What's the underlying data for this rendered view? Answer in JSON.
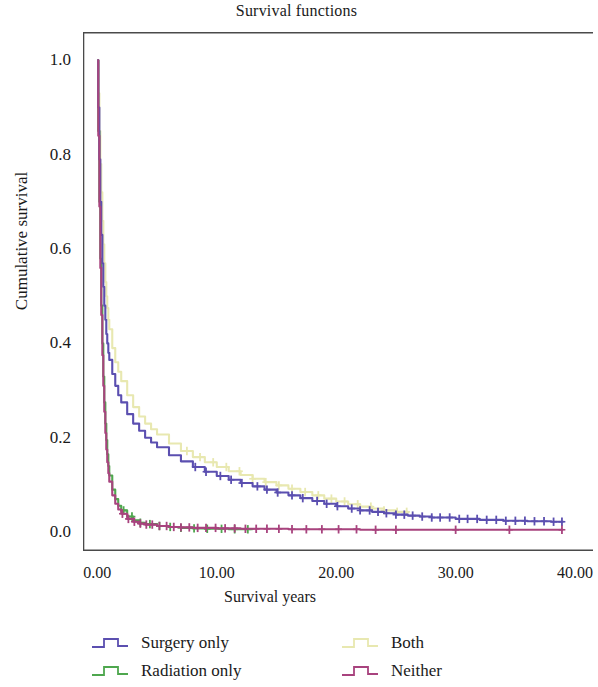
{
  "chart_data": {
    "type": "line",
    "title": "Survival functions",
    "xlabel": "Survival years",
    "ylabel": "Cumulative survival",
    "xlim": [
      -1.2,
      41.5
    ],
    "ylim": [
      -0.04,
      1.06
    ],
    "grid": false,
    "legend_position": "bottom",
    "xticks": [
      "0.00",
      "10.00",
      "20.00",
      "30.00",
      "40.00"
    ],
    "xtick_values": [
      0,
      10,
      20,
      30,
      40
    ],
    "yticks": [
      "0.0",
      "0.2",
      "0.4",
      "0.6",
      "0.8",
      "1.0"
    ],
    "ytick_values": [
      0.0,
      0.2,
      0.4,
      0.6,
      0.8,
      1.0
    ],
    "censor_marker": "plus",
    "series": [
      {
        "name": "Surgery only",
        "color": "#5b4fb0",
        "x": [
          0,
          0.08,
          0.17,
          0.25,
          0.33,
          0.42,
          0.5,
          0.58,
          0.67,
          0.75,
          0.83,
          0.92,
          1.0,
          1.25,
          1.5,
          1.75,
          2.0,
          2.5,
          3.0,
          3.5,
          4.0,
          4.5,
          5.0,
          6.0,
          7.0,
          8.0,
          9.0,
          10.0,
          11.0,
          12.0,
          13.0,
          14.0,
          15.0,
          16.0,
          17.0,
          18.0,
          19.0,
          20.0,
          21.0,
          22.0,
          23.0,
          24.0,
          25.0,
          26.0,
          27.0,
          28.0,
          30.0,
          32.0,
          34.0,
          36.0,
          38.0,
          39.0
        ],
        "y": [
          1.0,
          0.9,
          0.79,
          0.7,
          0.63,
          0.57,
          0.52,
          0.48,
          0.45,
          0.42,
          0.4,
          0.38,
          0.365,
          0.335,
          0.31,
          0.29,
          0.275,
          0.25,
          0.23,
          0.215,
          0.2,
          0.19,
          0.18,
          0.163,
          0.15,
          0.138,
          0.128,
          0.119,
          0.111,
          0.104,
          0.097,
          0.09,
          0.084,
          0.078,
          0.072,
          0.066,
          0.06,
          0.055,
          0.05,
          0.046,
          0.043,
          0.04,
          0.037,
          0.035,
          0.033,
          0.031,
          0.028,
          0.026,
          0.024,
          0.023,
          0.022,
          0.021
        ],
        "censor_x": [
          8.2,
          9.1,
          10.3,
          11.2,
          12.1,
          13.4,
          14.2,
          15.1,
          16.3,
          17.2,
          18.4,
          19.2,
          20.1,
          21.3,
          22.0,
          22.8,
          23.5,
          24.2,
          25.0,
          25.7,
          26.4,
          27.2,
          28.0,
          28.7,
          29.5,
          30.3,
          31.0,
          31.8,
          32.6,
          33.4,
          34.2,
          35.0,
          35.8,
          36.6,
          37.4,
          38.2,
          38.9
        ]
      },
      {
        "name": "Radiation only",
        "color": "#4ea74e",
        "x": [
          0,
          0.08,
          0.17,
          0.25,
          0.33,
          0.42,
          0.5,
          0.58,
          0.67,
          0.75,
          0.83,
          0.92,
          1.0,
          1.25,
          1.5,
          1.75,
          2.0,
          2.5,
          3.0,
          3.5,
          4.0,
          5.0,
          6.0,
          7.0,
          8.0,
          9.0,
          10.0,
          11.0,
          12.0,
          13.0
        ],
        "y": [
          1.0,
          0.85,
          0.7,
          0.58,
          0.48,
          0.4,
          0.33,
          0.275,
          0.23,
          0.195,
          0.165,
          0.14,
          0.12,
          0.09,
          0.07,
          0.056,
          0.046,
          0.033,
          0.025,
          0.02,
          0.017,
          0.013,
          0.011,
          0.009,
          0.008,
          0.007,
          0.007,
          0.006,
          0.006,
          0.005
        ],
        "censor_x": [
          2.2,
          2.9,
          3.6,
          4.4,
          5.2,
          6.1,
          7.0,
          8.1,
          9.2,
          10.4,
          11.5,
          12.6
        ]
      },
      {
        "name": "Both",
        "color": "#e8e8b0",
        "x": [
          0,
          0.08,
          0.17,
          0.25,
          0.33,
          0.42,
          0.5,
          0.58,
          0.67,
          0.75,
          0.83,
          0.92,
          1.0,
          1.25,
          1.5,
          1.75,
          2.0,
          2.5,
          3.0,
          3.5,
          4.0,
          4.5,
          5.0,
          6.0,
          7.0,
          8.0,
          9.0,
          10.0,
          11.0,
          12.0,
          13.0,
          14.0,
          15.0,
          16.0,
          17.0,
          18.0,
          19.0,
          20.0,
          21.0,
          22.0,
          23.0,
          24.0,
          25.0,
          26.0
        ],
        "y": [
          1.0,
          0.93,
          0.85,
          0.78,
          0.72,
          0.66,
          0.61,
          0.57,
          0.53,
          0.5,
          0.475,
          0.45,
          0.43,
          0.39,
          0.36,
          0.34,
          0.32,
          0.29,
          0.265,
          0.245,
          0.23,
          0.218,
          0.207,
          0.188,
          0.172,
          0.159,
          0.148,
          0.138,
          0.129,
          0.121,
          0.113,
          0.106,
          0.099,
          0.092,
          0.085,
          0.078,
          0.071,
          0.065,
          0.059,
          0.054,
          0.05,
          0.046,
          0.043,
          0.04
        ],
        "censor_x": [
          7.5,
          8.6,
          9.7,
          10.8,
          11.9,
          13.0,
          14.1,
          15.2,
          16.3,
          17.4,
          18.5,
          19.6,
          20.7,
          21.8,
          22.9,
          24.0,
          25.1,
          25.9
        ]
      },
      {
        "name": "Neither",
        "color": "#a8437e",
        "x": [
          0,
          0.08,
          0.17,
          0.25,
          0.33,
          0.42,
          0.5,
          0.58,
          0.67,
          0.75,
          0.83,
          0.92,
          1.0,
          1.25,
          1.5,
          1.75,
          2.0,
          2.5,
          3.0,
          3.5,
          4.0,
          5.0,
          6.0,
          7.0,
          8.0,
          10.0,
          12.0,
          14.0,
          16.0,
          18.0,
          20.0,
          22.0,
          24.0,
          25.0,
          30.0,
          34.0,
          38.0,
          39.0
        ],
        "y": [
          1.0,
          0.84,
          0.69,
          0.56,
          0.46,
          0.375,
          0.31,
          0.255,
          0.21,
          0.175,
          0.148,
          0.125,
          0.107,
          0.078,
          0.06,
          0.048,
          0.039,
          0.028,
          0.022,
          0.018,
          0.016,
          0.013,
          0.011,
          0.01,
          0.009,
          0.008,
          0.007,
          0.007,
          0.006,
          0.006,
          0.006,
          0.005,
          0.005,
          0.005,
          0.005,
          0.005,
          0.005,
          0.005
        ],
        "censor_x": [
          2.1,
          2.6,
          3.1,
          3.6,
          4.1,
          4.6,
          5.2,
          5.8,
          6.4,
          7.0,
          7.7,
          8.4,
          9.1,
          9.9,
          10.7,
          11.5,
          12.4,
          13.3,
          14.2,
          15.2,
          16.3,
          17.5,
          18.8,
          20.2,
          21.7,
          23.3,
          25.0,
          30.0,
          34.5,
          38.9
        ]
      }
    ]
  },
  "legend": {
    "items": [
      {
        "label": "Surgery only",
        "color": "#5b4fb0"
      },
      {
        "label": "Radiation only",
        "color": "#4ea74e"
      },
      {
        "label": "Both",
        "color": "#e8e8b0"
      },
      {
        "label": "Neither",
        "color": "#a8437e"
      }
    ]
  },
  "axis_frame_color": "#4a4a4a"
}
